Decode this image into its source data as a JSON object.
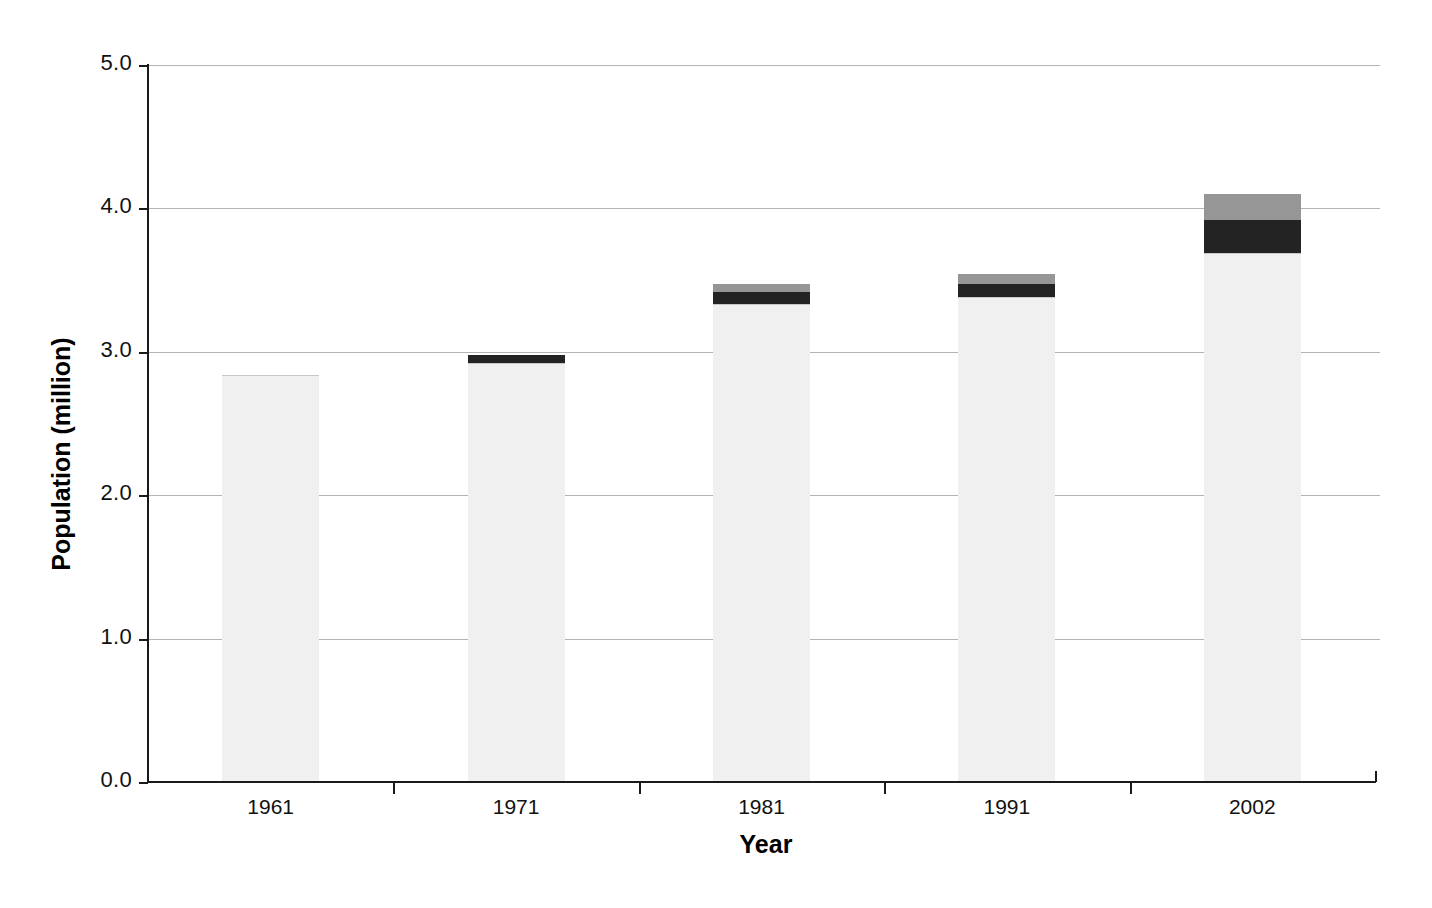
{
  "chart_data": {
    "type": "bar",
    "stacked": true,
    "title": "",
    "subtitle": "",
    "xlabel": "Year",
    "ylabel": "Population (million)",
    "categories": [
      "1961",
      "1971",
      "1981",
      "1991",
      "2002"
    ],
    "ylim": [
      0.0,
      5.0
    ],
    "ytick_labels": [
      "0.0",
      "1.0",
      "2.0",
      "3.0",
      "4.0",
      "5.0"
    ],
    "ytick_values": [
      0.0,
      1.0,
      2.0,
      3.0,
      4.0,
      5.0
    ],
    "grid": "horizontal",
    "legend": "none",
    "series": [
      {
        "name": "segment-1",
        "color": "#f0f0f0",
        "values": [
          2.84,
          2.92,
          3.33,
          3.38,
          3.69
        ]
      },
      {
        "name": "segment-2",
        "color": "#232323",
        "values": [
          0.0,
          0.06,
          0.09,
          0.09,
          0.23
        ]
      },
      {
        "name": "segment-3",
        "color": "#969696",
        "values": [
          0.0,
          0.0,
          0.05,
          0.07,
          0.18
        ]
      }
    ],
    "totals": [
      2.84,
      2.98,
      3.47,
      3.54,
      4.1
    ],
    "colors": {
      "axis": "#1a1a1a",
      "gridline": "#b4b4b4",
      "background": "#ffffff",
      "bar_light": "#f0f0f0",
      "bar_dark": "#232323",
      "bar_gray": "#969696",
      "text": "#111111"
    }
  }
}
